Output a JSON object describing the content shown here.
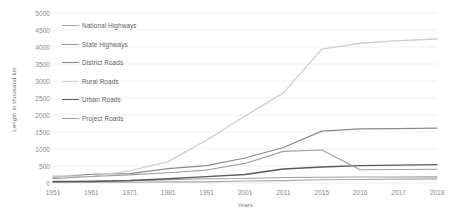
{
  "chart_data": {
    "type": "line",
    "title": "",
    "xlabel": "Years",
    "ylabel": "Length in thousand km",
    "categories": [
      "1951",
      "1961",
      "1971",
      "1981",
      "1991",
      "2001",
      "2011",
      "2015",
      "2016",
      "2017",
      "2018"
    ],
    "ylim": [
      0,
      5000
    ],
    "ytick_values": [
      0,
      500,
      1000,
      1500,
      2000,
      2500,
      3000,
      3500,
      4000,
      4500,
      5000
    ],
    "ytick_labels": [
      "0",
      "500",
      "1000",
      "1500",
      "2000",
      "2500",
      "3000",
      "3500",
      "4000",
      "4500",
      "5000"
    ],
    "grid": true,
    "legend_position": "upper-left-inside",
    "series": [
      {
        "name": "National Highways",
        "color": "#a6a6a6",
        "width": 1.1,
        "values": [
          20,
          24,
          24,
          32,
          34,
          58,
          71,
          97,
          101,
          115,
          122
        ]
      },
      {
        "name": "State Highways",
        "color": "#9c9c9c",
        "width": 1.1,
        "values": [
          25,
          56,
          57,
          94,
          127,
          132,
          163,
          167,
          176,
          176,
          179
        ]
      },
      {
        "name": "District Roads",
        "color": "#8a8a8a",
        "width": 1.2,
        "values": [
          173,
          257,
          276,
          421,
          509,
          736,
          1043,
          1526,
          1589,
          1602,
          1615
        ]
      },
      {
        "name": "Rural Roads",
        "color": "#cfcfcf",
        "width": 1.3,
        "values": [
          206,
          197,
          354,
          628,
          1260,
          1972,
          2650,
          3935,
          4110,
          4190,
          4235
        ]
      },
      {
        "name": "Urban Roads",
        "color": "#5a5a5a",
        "width": 1.4,
        "values": [
          46,
          46,
          72,
          123,
          186,
          252,
          412,
          470,
          510,
          527,
          540
        ]
      },
      {
        "name": "Project Roads",
        "color": "#a0a0a0",
        "width": 1.1,
        "values": [
          130,
          190,
          240,
          300,
          380,
          576,
          930,
          972,
          390,
          398,
          405
        ]
      }
    ]
  },
  "axes": {
    "xlabel": "Years",
    "ylabel": "Length in thousand km"
  }
}
